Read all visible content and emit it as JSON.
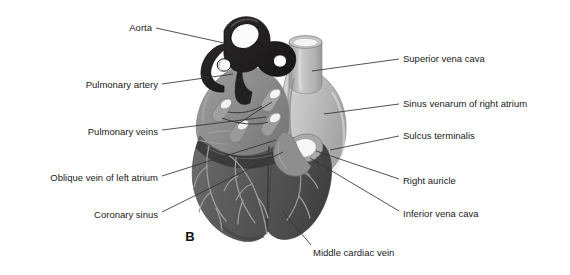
{
  "figure": {
    "panel_letter": "B",
    "title_alt": "Posterior view of the heart",
    "colors": {
      "background": "#ffffff",
      "aorta_dark": "#221f20",
      "atrium_mid_gray": "#8d8d8d",
      "sinus_light_gray": "#bdbdbd",
      "ventricle_dark_gray": "#5f5f5f",
      "ventricle_darker": "#4d4d4d",
      "vessel_line": "#2a2a2a",
      "lumen_white": "#f4f4f4",
      "leader_line": "#333333",
      "label_text": "#1a1a1a"
    },
    "labels_left": [
      {
        "id": "aorta",
        "text": "Aorta",
        "x": 152,
        "y": 27,
        "leader": "M156,28 L224,43"
      },
      {
        "id": "pulmonary-artery",
        "text": "Pulmonary artery",
        "x": 158,
        "y": 84,
        "leader": "M162,84 L233,74"
      },
      {
        "id": "pulmonary-veins",
        "text": "Pulmonary veins",
        "x": 158,
        "y": 131,
        "leader": "M162,130 L266,117"
      },
      {
        "id": "oblique-vein-of-left-atrium",
        "text": "Oblique vein of left atrium",
        "x": 158,
        "y": 177,
        "leader": "M162,176 L276,140"
      },
      {
        "id": "coronary-sinus",
        "text": "Coronary sinus",
        "x": 158,
        "y": 214,
        "leader": "M162,212 L283,152"
      }
    ],
    "labels_right": [
      {
        "id": "superior-vena-cava",
        "text": "Superior vena cava",
        "x": 403,
        "y": 58,
        "leader": "M399,59 L312,71"
      },
      {
        "id": "sinus-venarum-of-right-atrium",
        "text": "Sinus venarum of right atrium",
        "x": 403,
        "y": 103,
        "leader": "M399,104 L324,114"
      },
      {
        "id": "sulcus-terminalis",
        "text": "Sulcus terminalis",
        "x": 403,
        "y": 135,
        "leader": "M399,136 L330,150"
      },
      {
        "id": "right-auricle",
        "text": "Right auricle",
        "x": 403,
        "y": 180,
        "leader": "M399,179 L316,151"
      },
      {
        "id": "inferior-vena-cava",
        "text": "Inferior vena cava",
        "x": 403,
        "y": 213,
        "leader": "M399,211 L310,158"
      }
    ],
    "labels_bottom": [
      {
        "id": "middle-cardiac-vein",
        "text": "Middle cardiac vein",
        "x": 313,
        "y": 252,
        "leader": "M311,245 L283,212"
      }
    ],
    "structures": [
      {
        "id": "aorta",
        "name": "Aorta"
      },
      {
        "id": "pulmonary-artery",
        "name": "Pulmonary artery"
      },
      {
        "id": "pulmonary-veins",
        "name": "Pulmonary veins",
        "count": 4
      },
      {
        "id": "superior-vena-cava",
        "name": "Superior vena cava"
      },
      {
        "id": "inferior-vena-cava",
        "name": "Inferior vena cava"
      },
      {
        "id": "sinus-venarum",
        "name": "Sinus venarum of right atrium"
      },
      {
        "id": "sulcus-terminalis",
        "name": "Sulcus terminalis"
      },
      {
        "id": "right-auricle",
        "name": "Right auricle"
      },
      {
        "id": "coronary-sinus",
        "name": "Coronary sinus"
      },
      {
        "id": "middle-cardiac-vein",
        "name": "Middle cardiac vein"
      },
      {
        "id": "oblique-vein-left-atrium",
        "name": "Oblique vein of left atrium"
      },
      {
        "id": "left-ventricle",
        "name": "Left ventricle"
      },
      {
        "id": "right-ventricle",
        "name": "Right ventricle"
      }
    ]
  }
}
